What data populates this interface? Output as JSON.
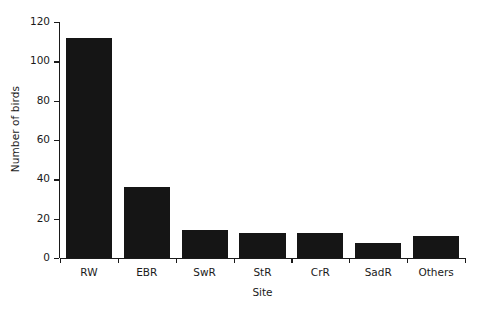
{
  "chart_data": {
    "type": "bar",
    "title": "",
    "subtitle": "",
    "xlabel": "Site",
    "ylabel": "Number of birds",
    "categories": [
      "RW",
      "EBR",
      "SwR",
      "StR",
      "CrR",
      "SadR",
      "Others"
    ],
    "values": [
      112,
      36,
      14,
      12.5,
      12.5,
      7.5,
      11
    ],
    "series": [
      {
        "name": "Number of birds",
        "values": [
          112,
          36,
          14,
          12.5,
          12.5,
          7.5,
          11
        ]
      }
    ],
    "ylim": [
      0,
      120
    ],
    "yticks": [
      0,
      20,
      40,
      60,
      80,
      100,
      120
    ],
    "ytick_labels": [
      "0",
      "20",
      "40",
      "60",
      "80",
      "100",
      "120"
    ],
    "xlim": [
      0,
      7
    ],
    "grid": false,
    "legend": false,
    "legend_position": "none",
    "bar_color": "#151515",
    "background_color": "#ffffff",
    "axis_color": "#1a1a1a"
  }
}
